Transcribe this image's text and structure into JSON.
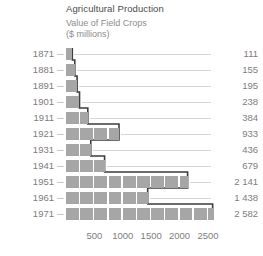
{
  "title": {
    "main": "Agricultural Production",
    "sub": "Value of Field Crops",
    "sub2": "($ millions)"
  },
  "colors": {
    "bar_fill": "#a6a6a6",
    "outline": "#3d3d3d",
    "leader": "#d6d6d6",
    "text": "#7d7d7d",
    "title": "#4a4a4a"
  },
  "chart_data": {
    "type": "bar",
    "orientation": "horizontal",
    "title": "Agricultural Production",
    "subtitle": "Value of Field Crops ($ millions)",
    "xlabel": "",
    "ylabel": "",
    "xlim": [
      0,
      2750
    ],
    "grid": false,
    "legend": null,
    "segment_unit": 250,
    "categories": [
      "1871",
      "1881",
      "1891",
      "1901",
      "1911",
      "1921",
      "1931",
      "1941",
      "1951",
      "1961",
      "1971"
    ],
    "values": [
      111,
      155,
      195,
      238,
      384,
      933,
      436,
      679,
      2141,
      1438,
      2582
    ],
    "value_labels": [
      "111",
      "155",
      "195",
      "238",
      "384",
      "933",
      "436",
      "679",
      "2 141",
      "1 438",
      "2 582"
    ],
    "xticks": [
      500,
      1000,
      1500,
      2000,
      2500
    ],
    "xtick_labels": [
      "500",
      "1000",
      "1500",
      "2000",
      "2500"
    ]
  }
}
